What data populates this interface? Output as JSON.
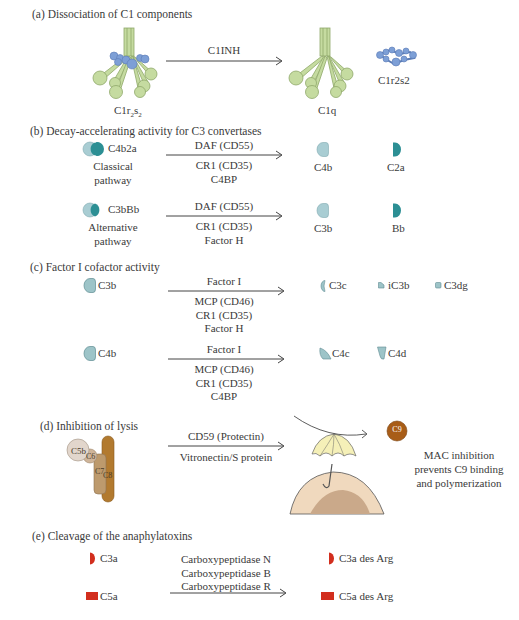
{
  "colors": {
    "c1q_green": "#c5dba0",
    "c1q_stroke": "#8fa86a",
    "c1rs_blue": "#7d9fd6",
    "light_teal": "#a9cdd3",
    "dark_teal": "#2c8f94",
    "c3b_grey_teal": "#9dc4c8",
    "anaphylatoxin_red": "#d22e1e",
    "c5b_beige": "#e2d6cc",
    "c6_tan": "#cfb59a",
    "c7_tan": "#bd9a6d",
    "c8_brown": "#b27a2f",
    "c9_brown": "#a85d18",
    "umbrella_yellow": "#f5f0b8",
    "cell_outer": "#f0d9be",
    "cell_inner": "#caa98a"
  },
  "sections": {
    "a": {
      "title": "(a) Dissociation of C1 components",
      "reactant_label": "C1r",
      "reactant_sub1": "2",
      "reactant_mid": "s",
      "reactant_sub2": "2",
      "arrow_label": "C1INH",
      "product1_label": "C1q",
      "product2_label": "C1r2s2"
    },
    "b": {
      "title": "(b) Decay-accelerating activity for C3 convertases",
      "rows": [
        {
          "complex": "C4b2a",
          "pathway_line1": "Classical",
          "pathway_line2": "pathway",
          "enzymes": [
            "DAF (CD55)",
            "CR1 (CD35)",
            "C4BP"
          ],
          "products": [
            "C4b",
            "C2a"
          ]
        },
        {
          "complex": "C3bBb",
          "pathway_line1": "Alternative",
          "pathway_line2": "pathway",
          "enzymes": [
            "DAF (CD55)",
            "CR1 (CD35)",
            "Factor H"
          ],
          "products": [
            "C3b",
            "Bb"
          ]
        }
      ]
    },
    "c": {
      "title": "(c) Factor I cofactor activity",
      "rows": [
        {
          "substrate": "C3b",
          "enzymes": [
            "Factor I",
            "MCP (CD46)",
            "CR1 (CD35)",
            "Factor H"
          ],
          "products": [
            "C3c",
            "iC3b",
            "C3dg"
          ]
        },
        {
          "substrate": "C4b",
          "enzymes": [
            "Factor I",
            "MCP (CD46)",
            "CR1 (CD35)",
            "C4BP"
          ],
          "products": [
            "C4c",
            "C4d"
          ]
        }
      ]
    },
    "d": {
      "title": "(d) Inhibition of lysis",
      "components": [
        "C5b",
        "C6",
        "C7",
        "C8"
      ],
      "enzymes": [
        "CD59 (Protectin)",
        "Vitronectin/S protein"
      ],
      "c9_label": "C9",
      "note": [
        "MAC inhibition",
        "prevents C9 binding",
        "and polymerization"
      ]
    },
    "e": {
      "title": "(e) Cleavage of the anaphylatoxins",
      "substrates": [
        "C3a",
        "C5a"
      ],
      "enzymes": [
        "Carboxypeptidase N",
        "Carboxypeptidase B",
        "Carboxypeptidase R"
      ],
      "products": [
        "C3a des Arg",
        "C5a des Arg"
      ]
    }
  }
}
